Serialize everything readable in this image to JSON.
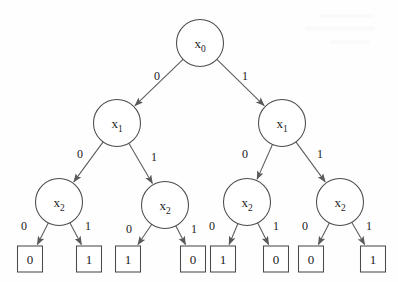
{
  "diagram": {
    "type": "binary-decision-tree",
    "background_color": "#fefefe",
    "stroke_color": "#4a4a4a",
    "text_color": "#1a1a1a",
    "node_radius": 23.5,
    "leaf_box": {
      "width": 25,
      "height": 26
    },
    "levels": [
      {
        "variable": "x",
        "subscript": "0",
        "depth": 0
      },
      {
        "variable": "x",
        "subscript": "1",
        "depth": 1
      },
      {
        "variable": "x",
        "subscript": "2",
        "depth": 2
      }
    ],
    "nodes": [
      {
        "id": "n0",
        "label": "x",
        "sub": "0",
        "cx": 200,
        "cy": 43
      },
      {
        "id": "n1L",
        "label": "x",
        "sub": "1",
        "cx": 117,
        "cy": 123
      },
      {
        "id": "n1R",
        "label": "x",
        "sub": "1",
        "cx": 282,
        "cy": 123
      },
      {
        "id": "n2a",
        "label": "x",
        "sub": "2",
        "cx": 59,
        "cy": 202
      },
      {
        "id": "n2b",
        "label": "x",
        "sub": "2",
        "cx": 165,
        "cy": 205
      },
      {
        "id": "n2c",
        "label": "x",
        "sub": "2",
        "cx": 247,
        "cy": 202
      },
      {
        "id": "n2d",
        "label": "x",
        "sub": "2",
        "cx": 340,
        "cy": 202
      }
    ],
    "leaves": [
      {
        "id": "l0",
        "value": "0",
        "cx": 30,
        "cy": 259
      },
      {
        "id": "l1",
        "value": "1",
        "cx": 89,
        "cy": 259
      },
      {
        "id": "l2",
        "value": "1",
        "cx": 128,
        "cy": 259
      },
      {
        "id": "l3",
        "value": "0",
        "cx": 193,
        "cy": 259
      },
      {
        "id": "l4",
        "value": "1",
        "cx": 223,
        "cy": 259
      },
      {
        "id": "l5",
        "value": "0",
        "cx": 276,
        "cy": 259
      },
      {
        "id": "l6",
        "value": "0",
        "cx": 311,
        "cy": 259
      },
      {
        "id": "l7",
        "value": "1",
        "cx": 373,
        "cy": 259
      }
    ],
    "edges": [
      {
        "from": "n0",
        "to": "n1L",
        "label": "0",
        "lx": 157,
        "ly": 80
      },
      {
        "from": "n0",
        "to": "n1R",
        "label": "1",
        "lx": 245,
        "ly": 80
      },
      {
        "from": "n1L",
        "to": "n2a",
        "label": "0",
        "lx": 80,
        "ly": 158
      },
      {
        "from": "n1L",
        "to": "n2b",
        "label": "1",
        "lx": 154,
        "ly": 161
      },
      {
        "from": "n1R",
        "to": "n2c",
        "label": "0",
        "lx": 245,
        "ly": 158
      },
      {
        "from": "n1R",
        "to": "n2d",
        "label": "1",
        "lx": 320,
        "ly": 158
      },
      {
        "from": "n2a",
        "to": "l0",
        "label": "0",
        "lx": 24,
        "ly": 230
      },
      {
        "from": "n2a",
        "to": "l1",
        "label": "1",
        "lx": 88,
        "ly": 230
      },
      {
        "from": "n2b",
        "to": "l2",
        "label": "0",
        "lx": 129,
        "ly": 233
      },
      {
        "from": "n2b",
        "to": "l3",
        "label": "1",
        "lx": 194,
        "ly": 233
      },
      {
        "from": "n2c",
        "to": "l4",
        "label": "0",
        "lx": 212,
        "ly": 230
      },
      {
        "from": "n2c",
        "to": "l5",
        "label": "1",
        "lx": 276,
        "ly": 230
      },
      {
        "from": "n2d",
        "to": "l6",
        "label": "0",
        "lx": 305,
        "ly": 230
      },
      {
        "from": "n2d",
        "to": "l7",
        "label": "1",
        "lx": 369,
        "ly": 230
      }
    ],
    "truth_table": {
      "headers": [
        "x0",
        "x1",
        "x2",
        "f"
      ],
      "rows": [
        [
          "0",
          "0",
          "0",
          "0"
        ],
        [
          "0",
          "0",
          "1",
          "1"
        ],
        [
          "0",
          "1",
          "0",
          "1"
        ],
        [
          "0",
          "1",
          "1",
          "0"
        ],
        [
          "1",
          "0",
          "0",
          "1"
        ],
        [
          "1",
          "0",
          "1",
          "0"
        ],
        [
          "1",
          "1",
          "0",
          "0"
        ],
        [
          "1",
          "1",
          "1",
          "1"
        ]
      ]
    }
  }
}
